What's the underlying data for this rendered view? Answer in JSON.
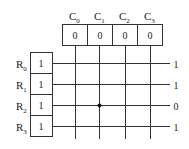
{
  "diagram": {
    "columns": [
      {
        "label": "C",
        "sub": "0",
        "value": "0"
      },
      {
        "label": "C",
        "sub": "1",
        "value": "0"
      },
      {
        "label": "C",
        "sub": "2",
        "value": "0"
      },
      {
        "label": "C",
        "sub": "3",
        "value": "0"
      }
    ],
    "rows": [
      {
        "label": "R",
        "sub": "0",
        "value": "1",
        "output": "1"
      },
      {
        "label": "R",
        "sub": "1",
        "value": "1",
        "output": "1"
      },
      {
        "label": "R",
        "sub": "2",
        "value": "1",
        "output": "0"
      },
      {
        "label": "R",
        "sub": "3",
        "value": "1",
        "output": "1"
      }
    ],
    "connection": {
      "row": 2,
      "column": 1
    }
  }
}
